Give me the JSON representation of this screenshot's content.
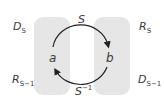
{
  "diagram": {
    "left_set": {
      "top_label": {
        "base": "D",
        "sub": "S"
      },
      "bottom_label": {
        "base": "R",
        "sub": "S−1"
      },
      "element": "a"
    },
    "right_set": {
      "top_label": {
        "base": "R",
        "sub": "S"
      },
      "bottom_label": {
        "base": "D",
        "sub": "S−1"
      },
      "element": "b"
    },
    "top_arrow": {
      "base": "S",
      "sup": ""
    },
    "bottom_arrow": {
      "base": "S",
      "sup": "−1"
    },
    "colors": {
      "box": "#e6e6e6",
      "arrow": "#222222",
      "text": "#3a3a3a"
    }
  }
}
